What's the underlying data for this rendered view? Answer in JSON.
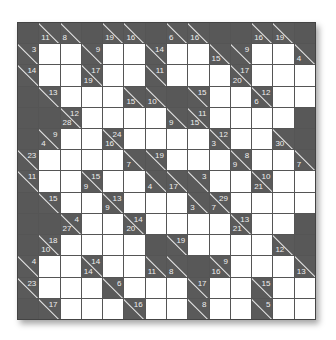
{
  "puzzle": {
    "type": "kakuro",
    "rows": 14,
    "cols": 14,
    "legend": "W = white entry cell, B = black cell, [down,right] = clue cell",
    "grid": [
      [
        "B",
        [
          11,
          null
        ],
        [
          8,
          null
        ],
        "B",
        [
          19,
          null
        ],
        [
          16,
          null
        ],
        "B",
        [
          6,
          null
        ],
        [
          16,
          null
        ],
        "B",
        "B",
        [
          16,
          null
        ],
        [
          19,
          null
        ],
        "B"
      ],
      [
        [
          null,
          3
        ],
        "W",
        "W",
        [
          null,
          9
        ],
        "W",
        "W",
        [
          null,
          14
        ],
        "W",
        "W",
        [
          15,
          null
        ],
        [
          null,
          9
        ],
        "W",
        "W",
        [
          4,
          null
        ]
      ],
      [
        [
          null,
          14
        ],
        "W",
        "W",
        [
          19,
          17
        ],
        "W",
        "W",
        [
          null,
          11
        ],
        "W",
        "W",
        "W",
        [
          20,
          17
        ],
        "W",
        "W",
        "W"
      ],
      [
        "B",
        [
          null,
          13
        ],
        "W",
        "W",
        "W",
        [
          15,
          null
        ],
        [
          10,
          null
        ],
        "B",
        [
          null,
          15
        ],
        "W",
        "W",
        [
          6,
          12
        ],
        "W",
        "W"
      ],
      [
        "B",
        "B",
        [
          28,
          12
        ],
        "W",
        "W",
        "W",
        "W",
        [
          9,
          null
        ],
        [
          15,
          11
        ],
        "W",
        "W",
        "W",
        "W",
        "B"
      ],
      [
        "B",
        [
          4,
          9
        ],
        "W",
        "W",
        [
          16,
          24
        ],
        "W",
        "W",
        "W",
        "W",
        [
          3,
          12
        ],
        "W",
        "W",
        [
          30,
          null
        ],
        "B"
      ],
      [
        [
          null,
          23
        ],
        "W",
        "W",
        "W",
        "W",
        [
          7,
          null
        ],
        [
          null,
          19
        ],
        "W",
        "W",
        "W",
        [
          9,
          8
        ],
        "W",
        "W",
        [
          7,
          null
        ]
      ],
      [
        [
          null,
          11
        ],
        "W",
        "W",
        [
          9,
          15
        ],
        "W",
        "W",
        [
          4,
          null
        ],
        [
          17,
          null
        ],
        [
          null,
          3
        ],
        "W",
        "W",
        [
          21,
          10
        ],
        "W",
        "W"
      ],
      [
        "B",
        [
          null,
          15
        ],
        "W",
        "W",
        [
          9,
          13
        ],
        "W",
        "W",
        "W",
        [
          3,
          null
        ],
        [
          7,
          29
        ],
        "W",
        "W",
        "W",
        "W"
      ],
      [
        "B",
        "B",
        [
          27,
          4
        ],
        "W",
        "W",
        [
          20,
          14
        ],
        "W",
        "W",
        "W",
        "W",
        [
          21,
          13
        ],
        "W",
        "W",
        "B"
      ],
      [
        "B",
        [
          10,
          18
        ],
        "W",
        "W",
        "W",
        "W",
        "B",
        [
          null,
          19
        ],
        "W",
        "W",
        "W",
        "W",
        [
          12,
          null
        ],
        "B"
      ],
      [
        [
          null,
          4
        ],
        "W",
        "W",
        [
          14,
          14
        ],
        "W",
        "W",
        [
          11,
          null
        ],
        [
          8,
          null
        ],
        "B",
        [
          16,
          9
        ],
        "W",
        "W",
        "W",
        [
          13,
          null
        ]
      ],
      [
        [
          null,
          23
        ],
        "W",
        "W",
        "W",
        [
          null,
          6
        ],
        "W",
        "W",
        "W",
        [
          null,
          17
        ],
        "W",
        "W",
        [
          null,
          15
        ],
        "W",
        "W"
      ],
      [
        "B",
        [
          null,
          17
        ],
        "W",
        "W",
        "W",
        [
          null,
          16
        ],
        "W",
        "W",
        [
          null,
          8
        ],
        "W",
        "W",
        [
          null,
          5
        ],
        "W",
        "W"
      ]
    ]
  },
  "colors": {
    "black_cell": "#585858",
    "white_cell": "#ffffff",
    "clue_text": "#eeeeee"
  }
}
